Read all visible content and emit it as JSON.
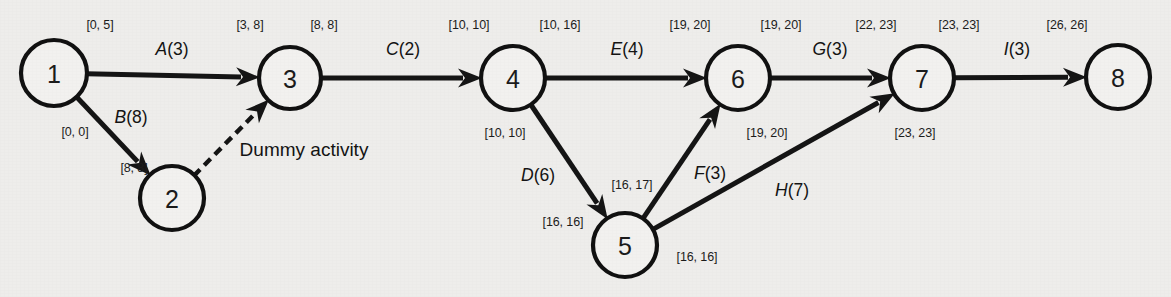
{
  "diagram": {
    "background_color": "#eeedeb",
    "ink_color": "#151515",
    "nodes": [
      {
        "id": "1",
        "label": "1",
        "cx": 54,
        "cy": 73,
        "r": 33
      },
      {
        "id": "2",
        "label": "2",
        "cx": 172,
        "cy": 198,
        "r": 32
      },
      {
        "id": "3",
        "label": "3",
        "cx": 290,
        "cy": 78,
        "r": 31
      },
      {
        "id": "4",
        "label": "4",
        "cx": 513,
        "cy": 78,
        "r": 32
      },
      {
        "id": "5",
        "label": "5",
        "cx": 625,
        "cy": 245,
        "r": 32
      },
      {
        "id": "6",
        "label": "6",
        "cx": 738,
        "cy": 78,
        "r": 32
      },
      {
        "id": "7",
        "label": "7",
        "cx": 922,
        "cy": 78,
        "r": 32
      },
      {
        "id": "8",
        "label": "8",
        "cx": 1118,
        "cy": 77,
        "r": 32
      }
    ],
    "edges": [
      {
        "id": "A",
        "from": "1",
        "to": "3",
        "label_letter": "A",
        "label_duration": "(3)",
        "label": "A(3)",
        "lx": 172,
        "ly": 49,
        "dashed": false
      },
      {
        "id": "B",
        "from": "1",
        "to": "2",
        "label_letter": "B",
        "label_duration": "(8)",
        "label": "B(8)",
        "lx": 131,
        "ly": 117,
        "dashed": false
      },
      {
        "id": "DUMMY",
        "from": "2",
        "to": "3",
        "label_letter": "",
        "label_duration": "",
        "label": "Dummy activity",
        "lx": 304,
        "ly": 150,
        "dashed": true
      },
      {
        "id": "C",
        "from": "3",
        "to": "4",
        "label_letter": "C",
        "label_duration": "(2)",
        "label": "C(2)",
        "lx": 403,
        "ly": 49,
        "dashed": false
      },
      {
        "id": "D",
        "from": "4",
        "to": "5",
        "label_letter": "D",
        "label_duration": "(6)",
        "label": "D(6)",
        "lx": 538,
        "ly": 175,
        "dashed": false
      },
      {
        "id": "E",
        "from": "4",
        "to": "6",
        "label_letter": "E",
        "label_duration": "(4)",
        "label": "E(4)",
        "lx": 627,
        "ly": 49,
        "dashed": false
      },
      {
        "id": "F",
        "from": "5",
        "to": "6",
        "label_letter": "F",
        "label_duration": "(3)",
        "label": "F(3)",
        "lx": 710,
        "ly": 173,
        "dashed": false
      },
      {
        "id": "G",
        "from": "6",
        "to": "7",
        "label_letter": "G",
        "label_duration": "(3)",
        "label": "G(3)",
        "lx": 830,
        "ly": 49,
        "dashed": false
      },
      {
        "id": "H",
        "from": "5",
        "to": "7",
        "label_letter": "H",
        "label_duration": "(7)",
        "label": "H(7)",
        "lx": 792,
        "ly": 190,
        "dashed": false
      },
      {
        "id": "I",
        "from": "7",
        "to": "8",
        "label_letter": "I",
        "label_duration": "(3)",
        "label": "I(3)",
        "lx": 1017,
        "ly": 49,
        "dashed": false
      }
    ],
    "time_labels": [
      {
        "id": "t-1-top",
        "text": "[0, 5]",
        "x": 100,
        "y": 25,
        "for_node": "1"
      },
      {
        "id": "t-1-bot",
        "text": "[0, 0]",
        "x": 75,
        "y": 132,
        "for_node": "1"
      },
      {
        "id": "t-2-left",
        "text": "[8, 8]",
        "x": 134,
        "y": 168,
        "for_node": "2"
      },
      {
        "id": "t-3-in",
        "text": "[3, 8]",
        "x": 250,
        "y": 25,
        "for_node": "3"
      },
      {
        "id": "t-3-out",
        "text": "[8, 8]",
        "x": 324,
        "y": 25,
        "for_node": "3"
      },
      {
        "id": "t-4-in",
        "text": "[10, 10]",
        "x": 469,
        "y": 25,
        "for_node": "4"
      },
      {
        "id": "t-4-out",
        "text": "[10, 16]",
        "x": 560,
        "y": 25,
        "for_node": "4"
      },
      {
        "id": "t-4-bot",
        "text": "[10, 10]",
        "x": 505,
        "y": 133,
        "for_node": "4"
      },
      {
        "id": "t-5-left",
        "text": "[16, 16]",
        "x": 563,
        "y": 222,
        "for_node": "5"
      },
      {
        "id": "t-5-top",
        "text": "[16, 17]",
        "x": 632,
        "y": 185,
        "for_node": "5"
      },
      {
        "id": "t-5-right",
        "text": "[16, 16]",
        "x": 697,
        "y": 257,
        "for_node": "5"
      },
      {
        "id": "t-6-in",
        "text": "[19, 20]",
        "x": 690,
        "y": 25,
        "for_node": "6"
      },
      {
        "id": "t-6-out",
        "text": "[19, 20]",
        "x": 781,
        "y": 25,
        "for_node": "6"
      },
      {
        "id": "t-6-bot",
        "text": "[19, 20]",
        "x": 767,
        "y": 133,
        "for_node": "6"
      },
      {
        "id": "t-7-in",
        "text": "[22, 23]",
        "x": 876,
        "y": 25,
        "for_node": "7"
      },
      {
        "id": "t-7-out",
        "text": "[23, 23]",
        "x": 959,
        "y": 25,
        "for_node": "7"
      },
      {
        "id": "t-7-bot",
        "text": "[23, 23]",
        "x": 915,
        "y": 133,
        "for_node": "7"
      },
      {
        "id": "t-8-top",
        "text": "[26, 26]",
        "x": 1067,
        "y": 25,
        "for_node": "8"
      }
    ]
  }
}
